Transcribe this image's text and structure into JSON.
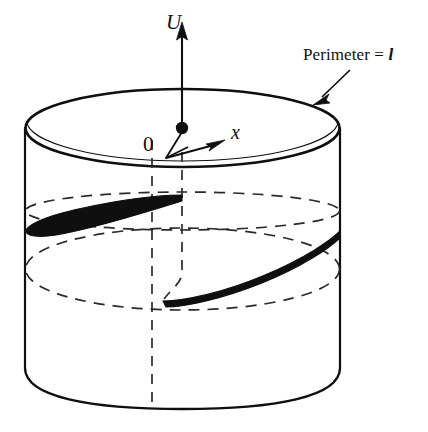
{
  "figure": {
    "background_color": "#ffffff",
    "stroke_color": "#100f10",
    "labels": {
      "vertical_axis": "U",
      "radial_axis": "x",
      "origin": "0",
      "perimeter_text": "Perimeter =",
      "perimeter_symbol": "l"
    },
    "geometry": {
      "cylinder": {
        "left_x": 25,
        "right_x": 340,
        "top_ellipse_center_y": 128,
        "top_ellipse_rx": 157,
        "top_ellipse_ry": 39,
        "bottom_front_arc_y": 408,
        "dashed_ellipse_1_center_y": 211,
        "dashed_ellipse_2_center_y": 269
      },
      "origin_dot": {
        "x": 182,
        "y": 129,
        "r": 6
      },
      "u_axis": {
        "x": 182,
        "from_y": 126,
        "to_y": 24
      },
      "x_axis_arrow_tip": {
        "x": 222,
        "y": 143
      },
      "perimeter_arrow": {
        "from_x": 349,
        "from_y": 71,
        "to_x": 314,
        "to_y": 104
      }
    }
  }
}
